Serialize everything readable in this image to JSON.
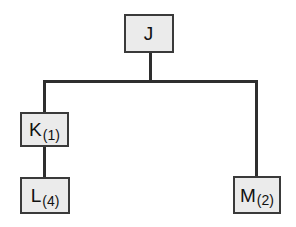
{
  "diagram": {
    "type": "tree",
    "colors": {
      "node_fill": "#ebebeb",
      "node_border": "#3a3a3a",
      "edge": "#2e2e2e"
    },
    "root": {
      "id": "J",
      "label": "J",
      "sub": ""
    },
    "nodes": [
      {
        "id": "J",
        "label": "J",
        "sub": ""
      },
      {
        "id": "K",
        "label": "K",
        "sub": "(1)"
      },
      {
        "id": "L",
        "label": "L",
        "sub": "(4)"
      },
      {
        "id": "M",
        "label": "M",
        "sub": "(2)"
      }
    ],
    "edges": [
      {
        "from": "J",
        "to": "K"
      },
      {
        "from": "J",
        "to": "M"
      },
      {
        "from": "K",
        "to": "L"
      }
    ]
  }
}
